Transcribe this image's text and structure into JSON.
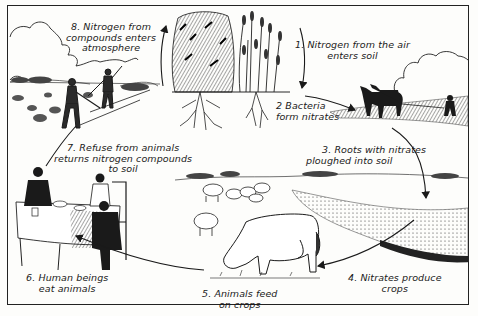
{
  "diagram": {
    "steps": [
      {
        "number": "1.",
        "lines": [
          "1. Nitrogen from the air",
          "enters soil"
        ]
      },
      {
        "number": "2",
        "lines": [
          "2 Bacteria",
          "form nitrates"
        ]
      },
      {
        "number": "3.",
        "lines": [
          "3. Roots with nitrates",
          "ploughed into soil"
        ]
      },
      {
        "number": "4.",
        "lines": [
          "4. Nitrates produce",
          "crops"
        ]
      },
      {
        "number": "5.",
        "lines": [
          "5. Animals feed",
          "on crops"
        ]
      },
      {
        "number": "6.",
        "lines": [
          "6. Human beings",
          "eat animals"
        ]
      },
      {
        "number": "7.",
        "lines": [
          "7. Refuse from animals",
          "returns nitrogen compounds",
          "to soil"
        ]
      },
      {
        "number": "8.",
        "lines": [
          "8. Nitrogen from",
          "compounds enters",
          "atmosphere"
        ]
      }
    ],
    "illustrations": [
      "leafy-plant-with-roots",
      "grain-plant-with-roots",
      "horses-ploughing-field",
      "crop-field",
      "sheep-flock",
      "grazing-cow",
      "family-at-dinner-table",
      "farmers-spreading-manure"
    ],
    "colors": {
      "ink": "#1a1a1a",
      "paper": "#fdfdfb"
    }
  }
}
